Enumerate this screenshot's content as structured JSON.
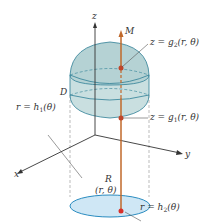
{
  "diagram": {
    "labels": {
      "z_axis": "z",
      "x_axis": "x",
      "y_axis": "y",
      "M": "M",
      "D": "D",
      "R": "R",
      "point": "(r, θ)",
      "upper_surface_prefix": "z = g",
      "upper_surface_sub": "2",
      "upper_surface_suffix": "(r, θ)",
      "lower_surface_prefix": "z = g",
      "lower_surface_sub": "1",
      "lower_surface_suffix": "(r, θ)",
      "inner_curve_prefix": "r = h",
      "inner_curve_sub": "1",
      "inner_curve_suffix": "(θ)",
      "outer_curve_prefix": "r = h",
      "outer_curve_sub": "2",
      "outer_curve_suffix": "(θ)"
    },
    "colors": {
      "solid_fill": "#c9dfe0",
      "solid_top": "#b5d2d4",
      "solid_edge": "#2e7f95",
      "region_fill": "#cfe7f5",
      "region_edge": "#2a8cc0",
      "line_segment": "#c0682a",
      "point": "#d8302a",
      "axes": "#333333",
      "leader": "#555555"
    }
  }
}
